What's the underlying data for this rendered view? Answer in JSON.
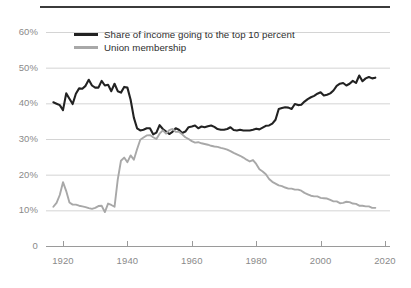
{
  "chart_data": {
    "type": "line",
    "title": "",
    "subtitle": "",
    "xlabel": "",
    "ylabel": "",
    "xlim": [
      1917,
      2020
    ],
    "ylim": [
      0,
      62
    ],
    "grid": "horizontal",
    "legend_position": "top-left-inside",
    "x_ticks": [
      "1920",
      "1940",
      "1960",
      "1980",
      "2000",
      "2020"
    ],
    "x_tick_values": [
      1920,
      1940,
      1960,
      1980,
      2000,
      2020
    ],
    "y_ticks": [
      "0",
      "10%",
      "20%",
      "30%",
      "40%",
      "50%",
      "60%"
    ],
    "y_tick_values": [
      0,
      10,
      20,
      30,
      40,
      50,
      60
    ],
    "colors": {
      "income_share": "#222222",
      "union_membership": "#a8a8a8",
      "gridline": "#d4d4d4",
      "axis_text": "#8a8a8a",
      "top_rule": "#3b3b3b"
    },
    "series": [
      {
        "name": "Share of income going to the top 10 percent",
        "color": "#222222",
        "x": [
          1917,
          1918,
          1919,
          1920,
          1921,
          1922,
          1923,
          1924,
          1925,
          1926,
          1927,
          1928,
          1929,
          1930,
          1931,
          1932,
          1933,
          1934,
          1935,
          1936,
          1937,
          1938,
          1939,
          1940,
          1941,
          1942,
          1943,
          1944,
          1945,
          1946,
          1947,
          1948,
          1949,
          1950,
          1951,
          1952,
          1953,
          1954,
          1955,
          1956,
          1957,
          1958,
          1959,
          1960,
          1961,
          1962,
          1963,
          1964,
          1965,
          1966,
          1967,
          1968,
          1969,
          1970,
          1971,
          1972,
          1973,
          1974,
          1975,
          1976,
          1977,
          1978,
          1979,
          1980,
          1981,
          1982,
          1983,
          1984,
          1985,
          1986,
          1987,
          1988,
          1989,
          1990,
          1991,
          1992,
          1993,
          1994,
          1995,
          1996,
          1997,
          1998,
          1999,
          2000,
          2001,
          2002,
          2003,
          2004,
          2005,
          2006,
          2007,
          2008,
          2009,
          2010,
          2011,
          2012,
          2013,
          2014,
          2015,
          2016,
          2017
        ],
        "values": [
          40.3,
          39.9,
          39.5,
          38.1,
          42.8,
          41.3,
          39.8,
          42.7,
          44.2,
          44.1,
          44.9,
          46.6,
          45.0,
          44.4,
          44.4,
          46.3,
          45.0,
          45.2,
          43.4,
          45.5,
          43.4,
          43.0,
          44.6,
          44.4,
          41.0,
          36.0,
          33.0,
          32.4,
          32.6,
          33.0,
          33.0,
          31.3,
          31.8,
          33.9,
          32.8,
          32.1,
          31.4,
          32.0,
          33.0,
          32.6,
          31.7,
          32.1,
          33.3,
          33.5,
          33.8,
          33.0,
          33.5,
          33.3,
          33.6,
          33.8,
          33.4,
          32.8,
          32.6,
          32.6,
          32.8,
          33.3,
          32.5,
          32.4,
          32.6,
          32.4,
          32.4,
          32.4,
          32.6,
          32.9,
          32.7,
          33.2,
          33.7,
          33.8,
          34.3,
          35.4,
          38.4,
          38.7,
          38.9,
          38.8,
          38.4,
          39.8,
          39.5,
          39.6,
          40.5,
          41.2,
          41.7,
          42.1,
          42.7,
          43.1,
          42.2,
          42.4,
          42.8,
          43.6,
          44.9,
          45.5,
          45.7,
          45.0,
          45.5,
          46.3,
          45.7,
          47.8,
          46.2,
          47.0,
          47.4,
          47.0,
          47.2
        ]
      },
      {
        "name": "Union membership",
        "color": "#a8a8a8",
        "x": [
          1917,
          1918,
          1919,
          1920,
          1921,
          1922,
          1923,
          1924,
          1925,
          1926,
          1927,
          1928,
          1929,
          1930,
          1931,
          1932,
          1933,
          1934,
          1935,
          1936,
          1937,
          1938,
          1939,
          1940,
          1941,
          1942,
          1943,
          1944,
          1945,
          1946,
          1947,
          1948,
          1949,
          1950,
          1951,
          1952,
          1953,
          1954,
          1955,
          1956,
          1957,
          1958,
          1959,
          1960,
          1961,
          1962,
          1963,
          1964,
          1965,
          1966,
          1967,
          1968,
          1969,
          1970,
          1971,
          1972,
          1973,
          1974,
          1975,
          1976,
          1977,
          1978,
          1979,
          1980,
          1981,
          1982,
          1983,
          1984,
          1985,
          1986,
          1987,
          1988,
          1989,
          1990,
          1991,
          1992,
          1993,
          1994,
          1995,
          1996,
          1997,
          1998,
          1999,
          2000,
          2001,
          2002,
          2003,
          2004,
          2005,
          2006,
          2007,
          2008,
          2009,
          2010,
          2011,
          2012,
          2013,
          2014,
          2015,
          2016,
          2017
        ],
        "values": [
          11.0,
          12.1,
          14.3,
          17.9,
          15.4,
          12.2,
          11.6,
          11.6,
          11.3,
          11.1,
          10.9,
          10.6,
          10.4,
          10.7,
          11.2,
          11.3,
          9.5,
          11.9,
          11.5,
          11.0,
          18.6,
          23.9,
          24.8,
          23.5,
          25.4,
          24.2,
          27.1,
          29.8,
          30.4,
          31.0,
          31.1,
          30.5,
          30.0,
          31.5,
          32.4,
          31.5,
          32.5,
          32.8,
          32.0,
          32.0,
          31.3,
          30.5,
          30.0,
          29.4,
          29.0,
          29.1,
          28.8,
          28.6,
          28.4,
          28.1,
          27.9,
          27.8,
          27.5,
          27.3,
          27.0,
          26.6,
          26.1,
          25.7,
          25.3,
          24.8,
          24.2,
          23.7,
          24.1,
          23.0,
          21.5,
          20.9,
          20.1,
          18.8,
          18.0,
          17.5,
          17.0,
          16.8,
          16.4,
          16.1,
          16.1,
          15.8,
          15.8,
          15.5,
          14.9,
          14.5,
          14.1,
          13.9,
          13.9,
          13.5,
          13.4,
          13.3,
          12.9,
          12.5,
          12.5,
          12.0,
          12.1,
          12.4,
          12.3,
          11.9,
          11.8,
          11.3,
          11.3,
          11.1,
          11.1,
          10.7,
          10.7
        ]
      }
    ],
    "legend": [
      {
        "label": "Share of income going to the top 10 percent",
        "color": "#222222",
        "weight": "thick"
      },
      {
        "label": "Union membership",
        "color": "#a8a8a8",
        "weight": "thin"
      }
    ]
  }
}
